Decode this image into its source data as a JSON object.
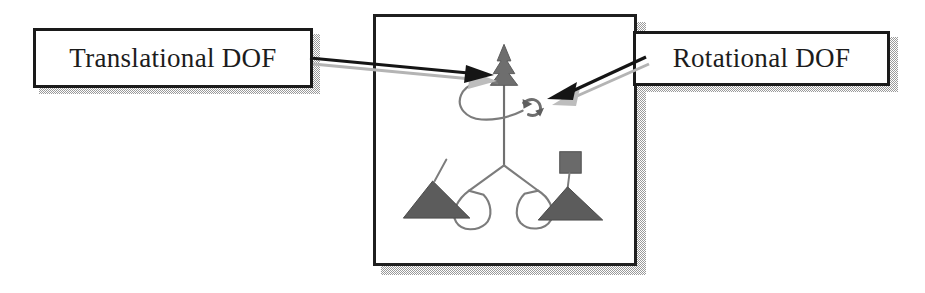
{
  "figure": {
    "background_color": "#ffffff",
    "ink_color": "#1c1c1c",
    "shadow_color": "#9a9a9a",
    "fill_gray": "#6e6e6e"
  },
  "callouts": [
    {
      "id": "translational",
      "label": "Translational DOF",
      "points_to": "upper-prismatic-joint-marker",
      "arrow_direction": "right"
    },
    {
      "id": "rotational",
      "label": "Rotational DOF",
      "points_to": "upper-revolute-joint-marker",
      "arrow_direction": "left"
    }
  ],
  "frame": {
    "name": "mechanism-illustration",
    "border_color": "#1f1f1f",
    "has_drop_shadow": true
  },
  "mechanism": {
    "description": "Three-legged parallel manipulator sketch with a central vertical column, a translational (cone) arrow marker at the top of the column, a rotational (curved) arrow marker beside it, and two splayed lower legs ending in shaded cone feet.",
    "parts": [
      {
        "name": "central-column",
        "type": "line"
      },
      {
        "name": "translational-cone-marker",
        "type": "cone-arrow"
      },
      {
        "name": "rotational-curved-marker",
        "type": "curved-arrow"
      },
      {
        "name": "upper-loop-link",
        "type": "closed-curve"
      },
      {
        "name": "left-lower-leg",
        "type": "line"
      },
      {
        "name": "right-lower-leg",
        "type": "line"
      },
      {
        "name": "left-foot-cone",
        "type": "filled-cone"
      },
      {
        "name": "right-foot-cone",
        "type": "filled-cone"
      },
      {
        "name": "left-loop-link",
        "type": "closed-curve"
      },
      {
        "name": "right-loop-link",
        "type": "closed-curve"
      },
      {
        "name": "right-cube-end-effector",
        "type": "filled-square"
      }
    ]
  },
  "arrows": {
    "left": {
      "name": "translational-leader-arrow",
      "from_x": 311,
      "from_y": 58,
      "to_x": 492,
      "to_y": 72,
      "head": "solid-triangle",
      "has_shadow": true
    },
    "right": {
      "name": "rotational-leader-arrow",
      "from_x": 645,
      "from_y": 57,
      "to_x": 543,
      "to_y": 99,
      "head": "solid-triangle",
      "has_shadow": true
    }
  }
}
